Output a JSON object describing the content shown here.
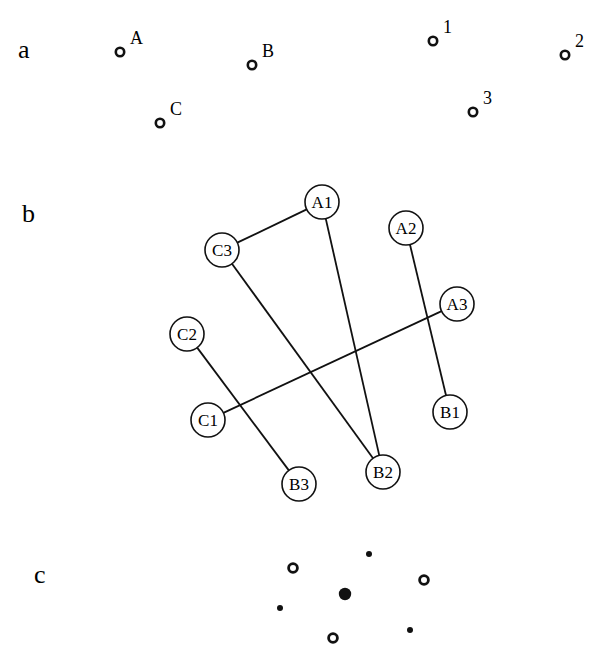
{
  "panels": {
    "a": {
      "label": "a",
      "points": [
        {
          "id": "A",
          "label": "A",
          "x": 120,
          "y": 52
        },
        {
          "id": "B",
          "label": "B",
          "x": 252,
          "y": 65
        },
        {
          "id": "C",
          "label": "C",
          "x": 160,
          "y": 123
        },
        {
          "id": "1",
          "label": "1",
          "x": 433,
          "y": 41
        },
        {
          "id": "2",
          "label": "2",
          "x": 565,
          "y": 55
        },
        {
          "id": "3",
          "label": "3",
          "x": 473,
          "y": 112
        }
      ]
    },
    "b": {
      "label": "b",
      "nodes": [
        {
          "id": "A1",
          "label": "A1",
          "x": 322,
          "y": 202
        },
        {
          "id": "A2",
          "label": "A2",
          "x": 406,
          "y": 228
        },
        {
          "id": "A3",
          "label": "A3",
          "x": 457,
          "y": 304
        },
        {
          "id": "B1",
          "label": "B1",
          "x": 450,
          "y": 412
        },
        {
          "id": "B2",
          "label": "B2",
          "x": 383,
          "y": 472
        },
        {
          "id": "B3",
          "label": "B3",
          "x": 299,
          "y": 484
        },
        {
          "id": "C1",
          "label": "C1",
          "x": 208,
          "y": 420
        },
        {
          "id": "C2",
          "label": "C2",
          "x": 187,
          "y": 334
        },
        {
          "id": "C3",
          "label": "C3",
          "x": 222,
          "y": 250
        }
      ],
      "edges": [
        [
          "A1",
          "C3"
        ],
        [
          "C3",
          "B2"
        ],
        [
          "A1",
          "B2"
        ],
        [
          "A2",
          "B1"
        ],
        [
          "A3",
          "C1"
        ],
        [
          "C2",
          "B3"
        ]
      ]
    },
    "c": {
      "label": "c",
      "open_points": [
        {
          "x": 293,
          "y": 568
        },
        {
          "x": 424,
          "y": 580
        },
        {
          "x": 333,
          "y": 638
        }
      ],
      "small_dots": [
        {
          "x": 369,
          "y": 554
        },
        {
          "x": 280,
          "y": 608
        },
        {
          "x": 410,
          "y": 630
        }
      ],
      "center_dot": {
        "x": 345,
        "y": 594
      }
    }
  }
}
